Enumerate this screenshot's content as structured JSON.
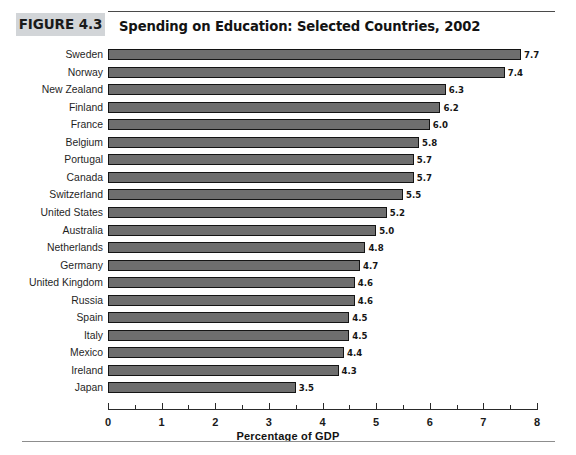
{
  "figure": {
    "badge": "FIGURE 4.3",
    "title": "Spending on Education: Selected Countries, 2002"
  },
  "colors": {
    "bar_fill": "#6e6e6e",
    "bar_stroke": "#141414",
    "badge_background": "#d2d5d8",
    "rule": "#4a4a4a",
    "text": "#1a1a1a"
  },
  "chart_data": {
    "type": "bar",
    "orientation": "horizontal",
    "title": "Spending on Education: Selected Countries, 2002",
    "xlabel": "Percentage of GDP",
    "ylabel": "",
    "xlim": [
      0,
      8
    ],
    "xticks": [
      0,
      1,
      2,
      3,
      4,
      5,
      6,
      7,
      8
    ],
    "xtick_labels": [
      "0",
      "1",
      "2",
      "3",
      "4",
      "5",
      "6",
      "7",
      "8"
    ],
    "minor_tick_interval": 0.5,
    "grid": false,
    "legend": null,
    "value_label_format": "one-decimal",
    "categories": [
      "Sweden",
      "Norway",
      "New Zealand",
      "Finland",
      "France",
      "Belgium",
      "Portugal",
      "Canada",
      "Switzerland",
      "United States",
      "Australia",
      "Netherlands",
      "Germany",
      "United Kingdom",
      "Russia",
      "Spain",
      "Italy",
      "Mexico",
      "Ireland",
      "Japan"
    ],
    "values": [
      7.7,
      7.4,
      6.3,
      6.2,
      6.0,
      5.8,
      5.7,
      5.7,
      5.5,
      5.2,
      5.0,
      4.8,
      4.7,
      4.6,
      4.6,
      4.5,
      4.5,
      4.4,
      4.3,
      3.5
    ],
    "data_labels": [
      "7.7",
      "7.4",
      "6.3",
      "6.2",
      "6.0",
      "5.8",
      "5.7",
      "5.7",
      "5.5",
      "5.2",
      "5.0",
      "4.8",
      "4.7",
      "4.6",
      "4.6",
      "4.5",
      "4.5",
      "4.4",
      "4.3",
      "3.5"
    ]
  }
}
